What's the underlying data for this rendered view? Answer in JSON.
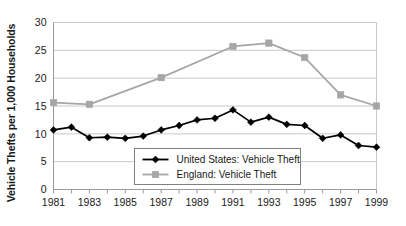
{
  "chart_data": {
    "type": "line",
    "title": "",
    "xlabel": "",
    "ylabel": "Vehicle Thefts per 1,000 Households",
    "x": [
      1981,
      1982,
      1983,
      1984,
      1985,
      1986,
      1987,
      1988,
      1989,
      1990,
      1991,
      1992,
      1993,
      1994,
      1995,
      1996,
      1997,
      1998,
      1999
    ],
    "xlim": [
      1981,
      1999
    ],
    "ylim": [
      0,
      30
    ],
    "yticks": [
      0,
      5,
      10,
      15,
      20,
      25,
      30
    ],
    "ytick_labels": [
      "0",
      "5",
      "10",
      "15",
      "20",
      "25",
      "30"
    ],
    "xticks": [
      1981,
      1982,
      1983,
      1984,
      1985,
      1986,
      1987,
      1988,
      1989,
      1990,
      1991,
      1992,
      1993,
      1994,
      1995,
      1996,
      1997,
      1998,
      1999
    ],
    "xtick_labels": [
      "1981",
      "",
      "1983",
      "",
      "1985",
      "",
      "1987",
      "",
      "1989",
      "",
      "1991",
      "",
      "1993",
      "",
      "1995",
      "",
      "1997",
      "",
      "1999"
    ],
    "grid": "horizontal",
    "legend_position": "inside-bottom-center",
    "series": [
      {
        "name": "United States: Vehicle Theft",
        "marker": "diamond",
        "color": "#000000",
        "values": [
          10.7,
          11.2,
          9.3,
          9.4,
          9.2,
          9.6,
          10.7,
          11.5,
          12.5,
          12.8,
          14.3,
          12.1,
          13.0,
          11.7,
          11.5,
          9.2,
          9.8,
          7.9,
          7.6
        ]
      },
      {
        "name": "England: Vehicle Theft",
        "marker": "square",
        "color": "#a6a6a6",
        "values": [
          15.6,
          null,
          15.3,
          null,
          null,
          null,
          20.1,
          null,
          null,
          null,
          25.7,
          null,
          26.3,
          null,
          23.7,
          null,
          17.0,
          null,
          15.0
        ]
      }
    ]
  },
  "legend": {
    "items": [
      {
        "label": "United States: Vehicle Theft",
        "color": "#000000",
        "marker": "diamond"
      },
      {
        "label": "England: Vehicle Theft",
        "color": "#a6a6a6",
        "marker": "square"
      }
    ]
  },
  "axis": {
    "y_title": "Vehicle Thefts per 1,000 Households"
  },
  "colors": {
    "us_series": "#000000",
    "england_series": "#a6a6a6",
    "gridline": "#c8c8c8",
    "axis": "#9a9a9a",
    "text": "#1a1a1a"
  }
}
